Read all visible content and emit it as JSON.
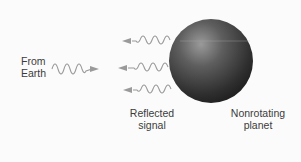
{
  "diagram": {
    "labels": {
      "source": [
        "From",
        "Earth"
      ],
      "reflected": [
        "Reflected",
        "signal"
      ],
      "planet": [
        "Nonrotating",
        "planet"
      ]
    },
    "colors": {
      "background": "#fbfbfb",
      "wave": "#9a9a9a",
      "planet_dark": "#2a2a2a",
      "planet_light": "#8a8a8a",
      "text": "#3c3c3c"
    }
  }
}
